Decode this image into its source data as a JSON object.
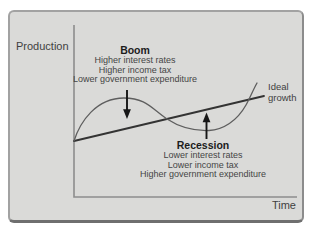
{
  "figure": {
    "axes": {
      "y_label": "Production",
      "x_label": "Time"
    },
    "trend": {
      "label_line1": "Ideal",
      "label_line2": "growth"
    },
    "boom": {
      "title": "Boom",
      "lines": [
        "Higher interest rates",
        "Higher income tax",
        "Lower government expenditure"
      ]
    },
    "recession": {
      "title": "Recession",
      "lines": [
        "Lower interest rates",
        "Lower income tax",
        "Higher government expenditure"
      ]
    },
    "colors": {
      "panel_background": "#dadad8",
      "panel_border": "#a2a2a2",
      "panel_border_bottom": "#6f6f6f",
      "axis_line": "#8d8d8d",
      "ideal_growth_line": "#333333",
      "cycle_curve": "#5e5e5e",
      "arrow": "#161616",
      "text": "#454545",
      "bold_text": "#1c1c1c"
    }
  }
}
